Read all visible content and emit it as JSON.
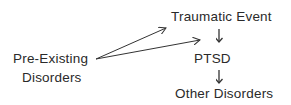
{
  "diagram": {
    "nodes": {
      "traumatic_event": "Traumatic Event",
      "pre_existing_line1": "Pre-Existing",
      "pre_existing_line2": "Disorders",
      "ptsd": "PTSD",
      "other_disorders": "Other Disorders"
    },
    "edges": [
      {
        "from": "Pre-Existing Disorders",
        "to": "Traumatic Event"
      },
      {
        "from": "Pre-Existing Disorders",
        "to": "PTSD"
      },
      {
        "from": "Traumatic Event",
        "to": "PTSD"
      },
      {
        "from": "PTSD",
        "to": "Other Disorders"
      }
    ],
    "colors": {
      "text": "#2a2a2a",
      "arrow": "#333333",
      "background": "#ffffff"
    }
  }
}
